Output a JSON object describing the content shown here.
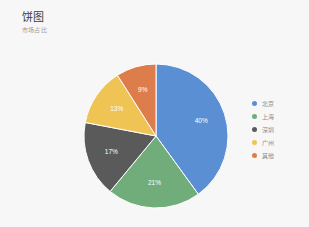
{
  "header": {
    "title": "饼图",
    "subtitle": "市场占比"
  },
  "chart_data": {
    "type": "pie",
    "title": "饼图",
    "subtitle": "市场占比",
    "xlabel": "",
    "ylabel": "",
    "legend_position": "right",
    "grid": false,
    "categories": [
      "北京",
      "上海",
      "深圳",
      "广州",
      "其他"
    ],
    "values": [
      40,
      21,
      17,
      13,
      9
    ],
    "value_labels": [
      "40%",
      "21%",
      "17%",
      "13%",
      "9%"
    ],
    "colors": [
      "#5b8fd4",
      "#70ad7b",
      "#5a5a5a",
      "#f0c355",
      "#de7d4c"
    ],
    "start_angle_deg": 0,
    "direction": "clockwise",
    "total": 100,
    "unit": "%"
  },
  "legend": {
    "items": [
      {
        "label": "北京",
        "color": "#5b8fd4"
      },
      {
        "label": "上海",
        "color": "#70ad7b"
      },
      {
        "label": "深圳",
        "color": "#5a5a5a"
      },
      {
        "label": "广州",
        "color": "#f0c355"
      },
      {
        "label": "其他",
        "color": "#de7d4c"
      }
    ]
  }
}
